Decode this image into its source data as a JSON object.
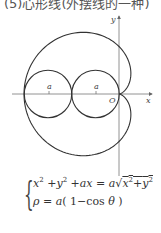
{
  "caption": "(5)心形线(外摆线的一种)",
  "figure": {
    "axes": {
      "x_label": "x",
      "y_label": "y",
      "origin_label": "O"
    },
    "circle_labels": [
      "a",
      "a"
    ],
    "curve_type": "cardioid",
    "parameter": "a",
    "line_color": "#333333",
    "axis_color": "#666666"
  },
  "formula": {
    "line1": {
      "lhs_x": "x",
      "lhs_exp1": "2",
      "plus1": " +",
      "lhs_y": "y",
      "lhs_exp2": "2",
      "plus2": " +",
      "ax": "ax",
      "eq": " = ",
      "a": "a",
      "sqrt_sign": "√",
      "rad_x": "x",
      "rad_exp1": "2",
      "rad_plus": "+",
      "rad_y": "y",
      "rad_exp2": "2"
    },
    "line2": {
      "rho": "ρ",
      "eq": " = ",
      "a": "a",
      "open": "( ",
      "one_minus": "1−",
      "cos": "cos ",
      "theta": "θ",
      "close": " )"
    },
    "text_line1": "x² + y² + ax = a√(x² + y²)",
    "text_line2": "ρ = a(1 − cos θ)"
  }
}
